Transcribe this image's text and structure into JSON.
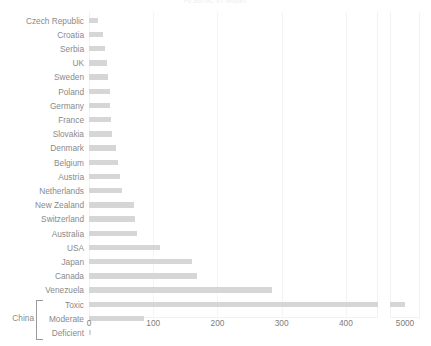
{
  "title": "Arsenic in water",
  "chart_data": {
    "type": "bar",
    "orientation": "horizontal",
    "title": "Arsenic in water",
    "xlabel": "",
    "ylabel": "",
    "grid": true,
    "legend": "none",
    "bar_color": "#d6d6d6",
    "axis_break": true,
    "xlim_main": [
      0,
      450
    ],
    "xlim_break": [
      4900,
      5100
    ],
    "xticks_main": [
      "0",
      "100",
      "200",
      "300",
      "400"
    ],
    "xtick_values_main": [
      0,
      100,
      200,
      300,
      400
    ],
    "xticks_break": [
      "5000"
    ],
    "xtick_values_break": [
      5000
    ],
    "categories": [
      "Czech Republic",
      "Croatia",
      "Serbia",
      "UK",
      "Sweden",
      "Poland",
      "Germany",
      "France",
      "Slovakia",
      "Denmark",
      "Belgium",
      "Austria",
      "Netherlands",
      "New Zealand",
      "Switzerland",
      "Australia",
      "USA",
      "Japan",
      "Canada",
      "Venezuela",
      "Toxic",
      "Moderate",
      "Deficient"
    ],
    "values": [
      14,
      22,
      25,
      28,
      30,
      32,
      33,
      35,
      36,
      42,
      45,
      48,
      52,
      70,
      72,
      75,
      110,
      160,
      168,
      285,
      5000,
      85,
      3
    ],
    "group": {
      "name": "China",
      "members": [
        "Toxic",
        "Moderate",
        "Deficient"
      ]
    }
  },
  "rows": [
    {
      "label": "Czech Republic",
      "value": 14,
      "grouped": false
    },
    {
      "label": "Croatia",
      "value": 22,
      "grouped": false
    },
    {
      "label": "Serbia",
      "value": 25,
      "grouped": false
    },
    {
      "label": "UK",
      "value": 28,
      "grouped": false
    },
    {
      "label": "Sweden",
      "value": 30,
      "grouped": false
    },
    {
      "label": "Poland",
      "value": 32,
      "grouped": false
    },
    {
      "label": "Germany",
      "value": 33,
      "grouped": false
    },
    {
      "label": "France",
      "value": 35,
      "grouped": false
    },
    {
      "label": "Slovakia",
      "value": 36,
      "grouped": false
    },
    {
      "label": "Denmark",
      "value": 42,
      "grouped": false
    },
    {
      "label": "Belgium",
      "value": 45,
      "grouped": false
    },
    {
      "label": "Austria",
      "value": 48,
      "grouped": false
    },
    {
      "label": "Netherlands",
      "value": 52,
      "grouped": false
    },
    {
      "label": "New Zealand",
      "value": 70,
      "grouped": false
    },
    {
      "label": "Switzerland",
      "value": 72,
      "grouped": false
    },
    {
      "label": "Australia",
      "value": 75,
      "grouped": false
    },
    {
      "label": "USA",
      "value": 110,
      "grouped": false
    },
    {
      "label": "Japan",
      "value": 160,
      "grouped": false
    },
    {
      "label": "Canada",
      "value": 168,
      "grouped": false
    },
    {
      "label": "Venezuela",
      "value": 285,
      "grouped": false
    },
    {
      "label": "Toxic",
      "value": 5000,
      "grouped": true
    },
    {
      "label": "Moderate",
      "value": 85,
      "grouped": true
    },
    {
      "label": "Deficient",
      "value": 3,
      "grouped": true
    }
  ],
  "group_label": "China"
}
